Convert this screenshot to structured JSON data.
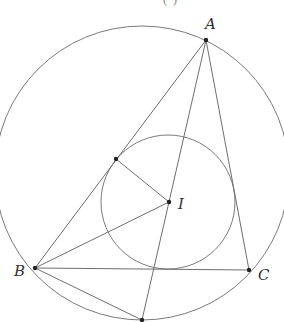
{
  "diagram": {
    "type": "geometry",
    "labels": {
      "A": "A",
      "B": "B",
      "C": "C",
      "I": "I"
    },
    "caption_partial": "(   )",
    "colors": {
      "stroke": "#6e6e6e",
      "point": "#222222",
      "label": "#333333"
    }
  }
}
